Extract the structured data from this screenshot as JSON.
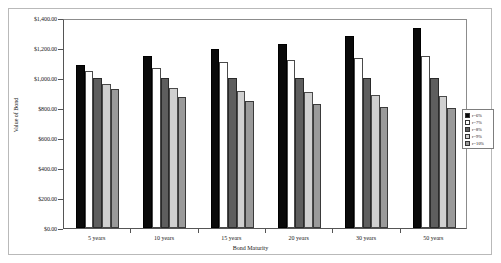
{
  "chart_data": {
    "type": "bar",
    "title": "",
    "xlabel": "Bond Maturity",
    "ylabel": "Value of Bond",
    "categories": [
      "5 years",
      "10 years",
      "15 years",
      "20 years",
      "30 years",
      "50 years"
    ],
    "series": [
      {
        "name": "r=6%",
        "color": "#0a0a0a",
        "values": [
          1085,
          1150,
          1195,
          1230,
          1280,
          1335
        ]
      },
      {
        "name": "r=7%",
        "color": "#ffffff",
        "values": [
          1045,
          1070,
          1105,
          1120,
          1135,
          1150
        ]
      },
      {
        "name": "r=8%",
        "color": "#5e5e5e",
        "values": [
          1000,
          1000,
          1000,
          1000,
          1000,
          1000
        ]
      },
      {
        "name": "r=9%",
        "color": "#d0d0d0",
        "values": [
          960,
          935,
          915,
          905,
          890,
          880
        ]
      },
      {
        "name": "r=10%",
        "color": "#9a9a9a",
        "values": [
          925,
          875,
          845,
          825,
          810,
          800
        ]
      }
    ],
    "ylim": [
      0,
      1400
    ],
    "yticks": [
      0,
      200,
      400,
      600,
      800,
      1000,
      1200,
      1400
    ],
    "ytick_labels": [
      "$0.00",
      "$200.00",
      "$400.00",
      "$600.00",
      "$800.00",
      "$1,000.00",
      "$1,200.00",
      "$1,400.00"
    ],
    "grid": false,
    "legend_position": "right"
  },
  "legend": {
    "items": [
      {
        "label": "r=6%"
      },
      {
        "label": "r=7%"
      },
      {
        "label": "r=8%"
      },
      {
        "label": "r=9%"
      },
      {
        "label": "r=10%"
      }
    ]
  }
}
